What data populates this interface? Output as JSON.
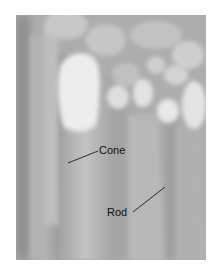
{
  "figure": {
    "type": "scanning electron micrograph",
    "background_color": "#ffffff",
    "image_tone": "#b4b4b4"
  },
  "labels": [
    {
      "id": "cone",
      "text": "Cone",
      "x": 99,
      "y": 145,
      "leader": {
        "x1": 98,
        "y1": 151,
        "x2": 68,
        "y2": 163
      }
    },
    {
      "id": "rod",
      "text": "Rod",
      "x": 107,
      "y": 207,
      "leader": {
        "x1": 133,
        "y1": 212,
        "x2": 165,
        "y2": 187
      }
    }
  ]
}
